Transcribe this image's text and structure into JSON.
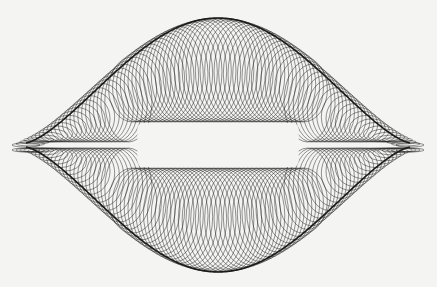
{
  "image": {
    "description": "line-art harmonograph-style pattern of looped curves forming a lens/bell shape with a horizontal white band in the center",
    "background_color": "#f4f4f2",
    "line_color": "#1a1a1a",
    "shape": {
      "center_x": 218,
      "center_y": 145,
      "half_width": 192,
      "top_y": 20,
      "bottom_y": 270,
      "gap_top_y": 122,
      "gap_bottom_y": 168,
      "loop_count": 90
    }
  }
}
